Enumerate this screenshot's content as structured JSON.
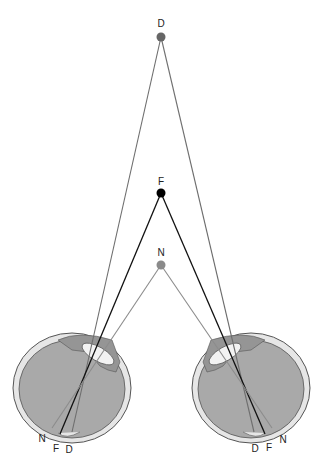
{
  "diagram": {
    "points": [
      {
        "id": "D",
        "label": "D",
        "x": 161,
        "y": 37,
        "color": "#666666"
      },
      {
        "id": "F",
        "label": "F",
        "x": 161,
        "y": 193,
        "color": "#000000"
      },
      {
        "id": "N",
        "label": "N",
        "x": 161,
        "y": 265,
        "color": "#8a8a8a"
      }
    ],
    "left_eye": {
      "retina_labels": [
        "N",
        "F",
        "D"
      ]
    },
    "right_eye": {
      "retina_labels": [
        "D",
        "F",
        "N"
      ]
    },
    "colors": {
      "eye_fill": "#a8a8a8",
      "sclera": "#e4e4e4",
      "outline": "#555555",
      "lens": "#f0f0f0",
      "distant_line": "#6e6e6e",
      "fixation_line": "#111111",
      "near_line": "#8c8c8c"
    }
  }
}
